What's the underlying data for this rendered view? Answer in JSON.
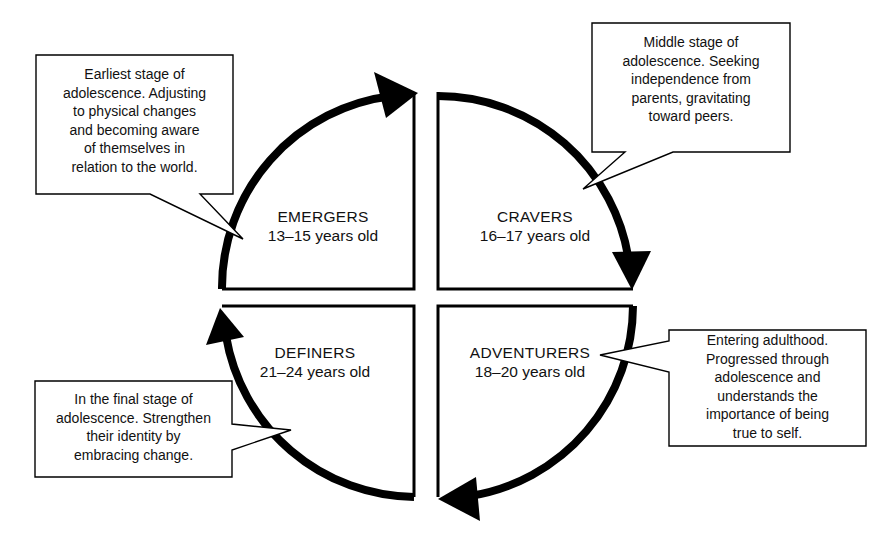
{
  "diagram": {
    "type": "cycle",
    "direction": "clockwise",
    "line_color": "#000000",
    "background": "#ffffff",
    "stages": [
      {
        "id": "emergers",
        "position": "top-left",
        "name": "EMERGERS",
        "age": "13–15 years old",
        "description": "Earliest stage of adolescence. Adjusting to physical changes and becoming aware of themselves in relation to the world.",
        "description_lines": [
          "Earliest stage of",
          "adolescence. Adjusting",
          "to physical changes",
          "and becoming aware",
          "of themselves in",
          "relation to the world."
        ]
      },
      {
        "id": "cravers",
        "position": "top-right",
        "name": "CRAVERS",
        "age": "16–17 years old",
        "description": "Middle stage of adolescence. Seeking independence from parents, gravitating toward peers.",
        "description_lines": [
          "Middle stage of",
          "adolescence. Seeking",
          "independence from",
          "parents, gravitating",
          "toward peers."
        ]
      },
      {
        "id": "adventurers",
        "position": "bottom-right",
        "name": "ADVENTURERS",
        "age": "18–20 years old",
        "description": "Entering adulthood. Progressed through adolescence and understands the importance of being true to self.",
        "description_lines": [
          "Entering adulthood.",
          "Progressed through",
          "adolescence and",
          "understands the",
          "importance of being",
          "true to self."
        ]
      },
      {
        "id": "definers",
        "position": "bottom-left",
        "name": "DEFINERS",
        "age": "21–24 years old",
        "description": "In the final stage of adolescence. Strengthen their identity by embracing change.",
        "description_lines": [
          "In the final stage of",
          "adolescence. Strengthen",
          "their identity by",
          "embracing change."
        ]
      }
    ]
  }
}
